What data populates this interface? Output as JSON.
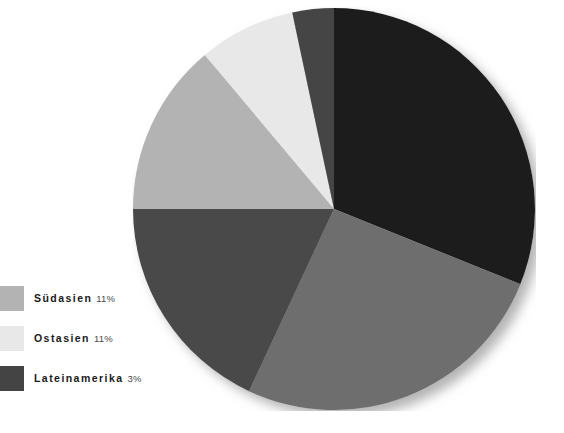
{
  "chart_data": {
    "type": "pie",
    "title": "",
    "subtitle": "",
    "xlabel": "",
    "ylabel": "",
    "legend_position": "left",
    "grid": false,
    "start_angle_deg": 0,
    "direction": "clockwise",
    "categories": [
      "Afrika",
      "Sonstige",
      "Naher Osten",
      "Südasien",
      "Ostasien",
      "Lateinamerika"
    ],
    "values": [
      31,
      26,
      18,
      11,
      11,
      3
    ],
    "labels": [
      "",
      "",
      "",
      "11%",
      "11%",
      "3%"
    ],
    "colors": [
      "#1f1f1f",
      "#6e6e6e",
      "#4a4a4a",
      "#b3b3b3",
      "#e8e8e8",
      "#444444"
    ],
    "slices": [
      {
        "name": "slice-1",
        "value": 31,
        "color": "#1f1f1f",
        "start_deg": 0,
        "end_deg": 112
      },
      {
        "name": "slice-2",
        "value": 26,
        "color": "#6e6e6e",
        "start_deg": 112,
        "end_deg": 205
      },
      {
        "name": "slice-3",
        "value": 18,
        "color": "#4a4a4a",
        "start_deg": 205,
        "end_deg": 270
      },
      {
        "name": "slice-4",
        "value": 11,
        "color": "#b3b3b3",
        "start_deg": 270,
        "end_deg": 320
      },
      {
        "name": "slice-5",
        "value": 11,
        "color": "#e8e8e8",
        "start_deg": 320,
        "end_deg": 348
      },
      {
        "name": "slice-6",
        "value": 3,
        "color": "#444444",
        "start_deg": 348,
        "end_deg": 360
      }
    ]
  },
  "legend": {
    "entries": [
      {
        "label": "Südasien",
        "value": "11%",
        "color": "#b3b3b3"
      },
      {
        "label": "Ostasien",
        "value": "11%",
        "color": "#e8e8e8"
      },
      {
        "label": "Lateinamerika",
        "value": "3%",
        "color": "#444444"
      }
    ]
  },
  "style": {
    "background": "#ffffff",
    "text_color": "#1a1a1a",
    "value_color": "#4a4a4a",
    "shadow_color": "#bdbdbd"
  }
}
